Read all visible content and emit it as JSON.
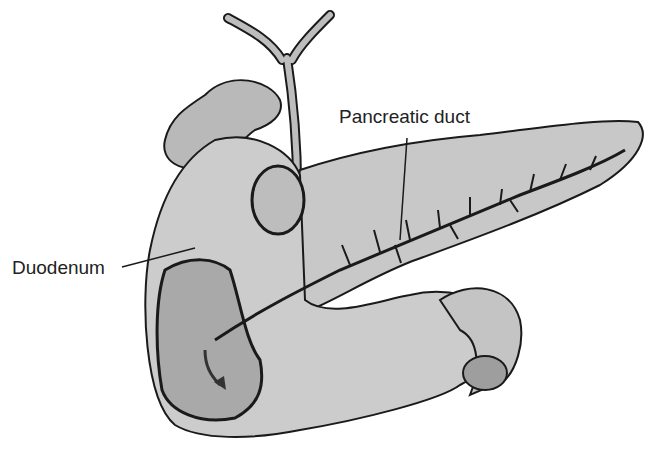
{
  "diagram": {
    "labels": {
      "pancreatic_duct": "Pancreatic duct",
      "duodenum": "Duodenum"
    },
    "colors": {
      "tissue": "#c8c8c8",
      "tissue_dark": "#a9a9a9",
      "outline": "#1a1a1a",
      "background": "#ffffff"
    }
  }
}
